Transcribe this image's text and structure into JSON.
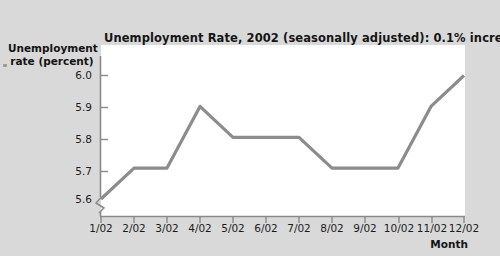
{
  "chart_data": {
    "type": "line",
    "title": "Unemployment Rate, 2002 (seasonally adjusted): 0.1% increments",
    "xlabel": "Month",
    "ylabel": "Unemployment rate (percent)",
    "ylabel_line1": "Unemployment",
    "ylabel_line2": "rate (percent)",
    "categories": [
      "1/02",
      "2/02",
      "3/02",
      "4/02",
      "5/02",
      "6/02",
      "7/02",
      "8/02",
      "9/02",
      "10/02",
      "11/02",
      "12/02"
    ],
    "values": [
      5.6,
      5.7,
      5.7,
      5.9,
      5.8,
      5.8,
      5.8,
      5.7,
      5.7,
      5.7,
      5.9,
      6.0
    ],
    "ytick_labels": [
      "6.0",
      "5.9",
      "5.8",
      "5.7",
      "5.6"
    ],
    "yticks": [
      6.0,
      5.9,
      5.8,
      5.7,
      5.6
    ],
    "ylim": [
      5.6,
      6.0
    ],
    "y_axis_broken": true,
    "axis_break_symbol": "zigzag",
    "grid": false,
    "legend": null,
    "series": [
      {
        "name": "Unemployment rate",
        "values": [
          5.6,
          5.7,
          5.7,
          5.9,
          5.8,
          5.8,
          5.8,
          5.7,
          5.7,
          5.7,
          5.9,
          6.0
        ],
        "color": "#8c8c8c"
      }
    ],
    "colors": {
      "line": "#8c8c8c",
      "axis": "#8a8a8a",
      "plot_background": "#ffffff",
      "page_background": "#d9d9d9",
      "text": "#151515"
    }
  }
}
